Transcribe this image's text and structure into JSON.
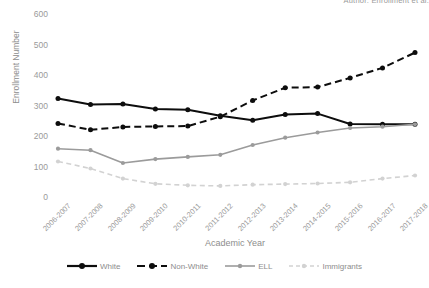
{
  "header": {
    "cropped_top_text": "Author: Enrollment et al."
  },
  "chart_data": {
    "type": "line",
    "title": "",
    "xlabel": "Academic Year",
    "ylabel": "Enrollment Number",
    "ylim": [
      0,
      600
    ],
    "ytick_step": 100,
    "yticks": [
      "0",
      "100",
      "200",
      "300",
      "400",
      "500",
      "600"
    ],
    "grid": false,
    "legend_position": "bottom",
    "categories": [
      "2006-2007",
      "2007-2008",
      "2008-2009",
      "2009-2010",
      "2010-2011",
      "2011-2012",
      "2012-2013",
      "2013-2014",
      "2014-2015",
      "2015-2016",
      "2016-2017",
      "2017-2018"
    ],
    "series": [
      {
        "name": "White",
        "color": "#0d0d0d",
        "style": "solid",
        "marker": "circle",
        "values": [
          325,
          305,
          307,
          290,
          288,
          268,
          253,
          272,
          275,
          241,
          240,
          240
        ]
      },
      {
        "name": "Non-White",
        "color": "#0d0d0d",
        "style": "dashed",
        "marker": "circle",
        "values": [
          243,
          222,
          231,
          233,
          234,
          265,
          318,
          360,
          362,
          392,
          425,
          475
        ]
      },
      {
        "name": "ELL",
        "color": "#9b9b9b",
        "style": "solid",
        "marker": "circle",
        "values": [
          160,
          155,
          113,
          126,
          133,
          140,
          172,
          196,
          213,
          228,
          232,
          240
        ]
      },
      {
        "name": "Immigrants",
        "color": "#d2d2d2",
        "style": "dashed",
        "marker": "circle",
        "values": [
          118,
          95,
          62,
          45,
          40,
          38,
          42,
          44,
          46,
          50,
          62,
          72
        ]
      }
    ]
  }
}
